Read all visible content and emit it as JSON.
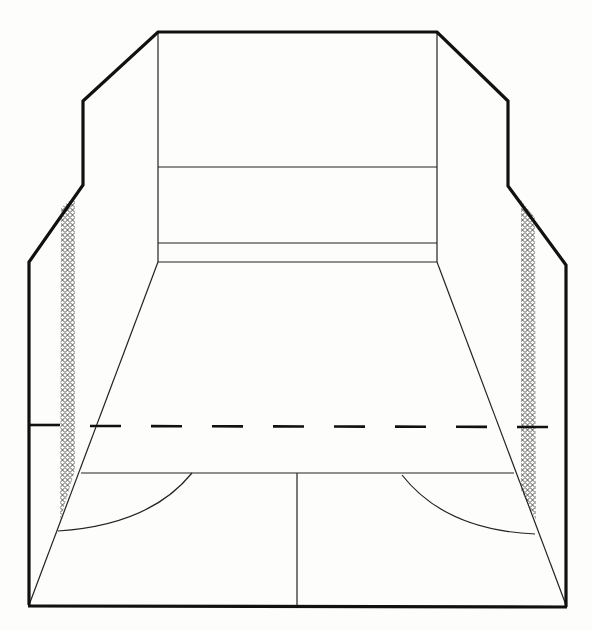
{
  "diagram": {
    "title": "",
    "colors": {
      "line": "#111111",
      "background": "#fdfdfc",
      "mesh": "#444444"
    },
    "elements": {
      "outer_outline": "court walls outline",
      "front_wall": "front wall with tin and board lines",
      "floor": "court floor",
      "short_line": "short line",
      "half_court_line": "half-court line",
      "service_boxes": [
        "left service box",
        "right service box"
      ],
      "out_line": "dashed out-of-court line on back/side walls",
      "mesh_panels": [
        "left side mesh",
        "right side mesh"
      ]
    },
    "labels": []
  }
}
